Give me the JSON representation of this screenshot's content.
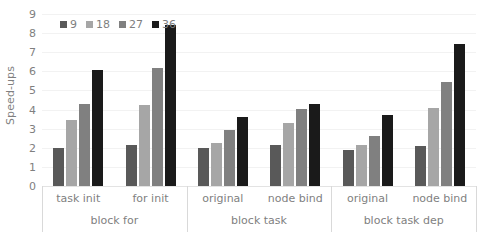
{
  "chart_data": {
    "type": "bar",
    "title": "",
    "xlabel": "",
    "ylabel": "Speed-ups",
    "ylim": [
      0,
      9
    ],
    "ytick_labels": [
      "9",
      "8",
      "7",
      "6",
      "5",
      "4",
      "3",
      "2",
      "1",
      "0"
    ],
    "yticks": [
      9,
      8,
      7,
      6,
      5,
      4,
      3,
      2,
      1,
      0
    ],
    "grid": true,
    "legend_position": "top-left",
    "legend": [
      "9",
      "18",
      "27",
      "36"
    ],
    "series_colors": [
      "#595959",
      "#a6a6a6",
      "#808080",
      "#1a1a1a"
    ],
    "groups": [
      {
        "label": "block for",
        "categories": [
          "task init",
          "for init"
        ]
      },
      {
        "label": "block task",
        "categories": [
          "original",
          "node bind"
        ]
      },
      {
        "label": "block task dep",
        "categories": [
          "original",
          "node bind"
        ]
      }
    ],
    "categories": [
      "task init",
      "for init",
      "original",
      "node bind",
      "original",
      "node bind"
    ],
    "series": [
      {
        "name": "9",
        "values": [
          2.0,
          2.15,
          2.0,
          2.15,
          1.9,
          2.1
        ]
      },
      {
        "name": "18",
        "values": [
          3.45,
          4.25,
          2.25,
          3.3,
          2.15,
          4.1
        ]
      },
      {
        "name": "27",
        "values": [
          4.3,
          6.2,
          2.95,
          4.05,
          2.6,
          5.45
        ]
      },
      {
        "name": "36",
        "values": [
          6.05,
          8.45,
          3.6,
          4.3,
          3.7,
          7.45
        ]
      }
    ]
  }
}
